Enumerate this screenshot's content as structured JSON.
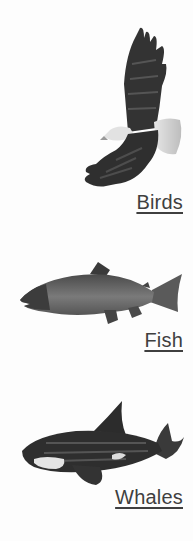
{
  "categories": [
    {
      "label": "Birds",
      "icon": "eagle-icon"
    },
    {
      "label": "Fish",
      "icon": "salmon-icon"
    },
    {
      "label": "Whales",
      "icon": "orca-icon"
    }
  ],
  "colors": {
    "background": "#fdfdfd",
    "link_text": "#3f3f3f",
    "image_dark": "#2e2e2e",
    "image_mid": "#6a6a6a",
    "image_light": "#d6d6d6"
  }
}
